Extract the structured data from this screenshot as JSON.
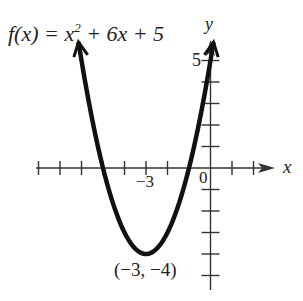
{
  "chart_data": {
    "type": "line",
    "function": "x^2 + 6x + 5",
    "xlabel": "x",
    "ylabel": "y",
    "xlim": [
      -8,
      3
    ],
    "ylim": [
      -5,
      5
    ],
    "grid": false,
    "x": [
      -6,
      -5.5,
      -5,
      -4.5,
      -4,
      -3.5,
      -3,
      -2.5,
      -2,
      -1.5,
      -1,
      -0.5,
      0
    ],
    "values": [
      5,
      2.25,
      0,
      -1.75,
      -3,
      -3.75,
      -4,
      -3.75,
      -3,
      -1.75,
      0,
      2.25,
      5
    ],
    "x_tick_labels": [
      "-3",
      "0"
    ],
    "y_tick_labels": [
      "5"
    ],
    "annotations": [
      {
        "text": "(−3, −4)",
        "x": -3,
        "y": -4,
        "meaning": "vertex"
      }
    ]
  },
  "labels": {
    "equation_prefix": "f(x) = x",
    "equation_exp": "2",
    "equation_suffix": " + 6x + 5",
    "y_axis": "y",
    "x_axis": "x",
    "y_tick_5": "5",
    "origin": "0",
    "x_tick_neg3": "−3",
    "vertex": "(−3, −4)"
  },
  "style": {
    "curve_color": "#111111",
    "axis_color": "#333333"
  }
}
